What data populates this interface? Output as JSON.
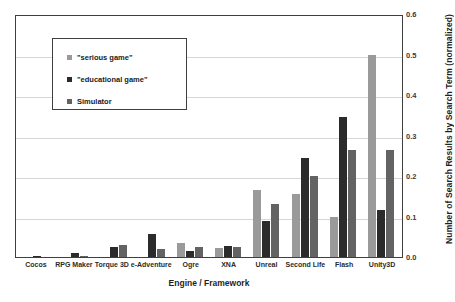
{
  "chart_data": {
    "type": "bar",
    "title": "",
    "xlabel": "Engine / Framework",
    "ylabel": "Number of Search Results by Search Term (normalized)",
    "ylim": [
      0,
      0.6
    ],
    "yticks": [
      "0.0",
      "0.1",
      "0.2",
      "0.3",
      "0.4",
      "0.5",
      "0.6"
    ],
    "ytick_values": [
      0.0,
      0.1,
      0.2,
      0.3,
      0.4,
      0.5,
      0.6
    ],
    "grid": true,
    "legend_position": "upper left",
    "categories": [
      "Cocos",
      "RPG Maker",
      "Torque 3D",
      "e-Adventure",
      "Ogre",
      "XNA",
      "Unreal",
      "Second Life",
      "Flash",
      "Unity3D"
    ],
    "series": [
      {
        "name": "\"serious game\"",
        "color": "#9a9a9a",
        "values": [
          0.0,
          0.0,
          0.0,
          0.0,
          0.035,
          0.022,
          0.165,
          0.155,
          0.1,
          0.5
        ]
      },
      {
        "name": "\"educational game\"",
        "color": "#2b2b2b",
        "values": [
          0.003,
          0.01,
          0.025,
          0.058,
          0.015,
          0.027,
          0.09,
          0.245,
          0.345,
          0.115
        ]
      },
      {
        "name": "Simulator",
        "color": "#636363",
        "values": [
          0.0,
          0.002,
          0.03,
          0.021,
          0.025,
          0.025,
          0.13,
          0.2,
          0.265,
          0.265
        ]
      }
    ]
  },
  "legend": {
    "items": [
      {
        "label": "\"serious game\"",
        "color": "#9a9a9a"
      },
      {
        "label": "\"educational game\"",
        "color": "#2b2b2b"
      },
      {
        "label": "Simulator",
        "color": "#636363"
      }
    ]
  }
}
